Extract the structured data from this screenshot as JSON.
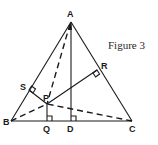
{
  "figure": {
    "caption": "Figure 3",
    "points": {
      "A": {
        "label": "A",
        "x": 71,
        "y": 22
      },
      "B": {
        "label": "B",
        "x": 11,
        "y": 121
      },
      "C": {
        "label": "C",
        "x": 132,
        "y": 121
      },
      "D": {
        "label": "D",
        "x": 71,
        "y": 121
      },
      "Q": {
        "label": "Q",
        "x": 47,
        "y": 121
      },
      "P": {
        "label": "P",
        "x": 47,
        "y": 104
      },
      "S": {
        "label": "S",
        "x": 29,
        "y": 90
      },
      "R": {
        "label": "R",
        "x": 97,
        "y": 70
      }
    },
    "solid_segments": [
      "AB",
      "BC",
      "CA",
      "AD",
      "PQ",
      "PR",
      "PS"
    ],
    "dashed_segments": [
      "AP",
      "BP",
      "CP"
    ],
    "right_angle_marks": [
      "Q",
      "D",
      "S",
      "R"
    ],
    "colors": {
      "stroke": "#1a1a1a",
      "background": "#ffffff"
    }
  }
}
